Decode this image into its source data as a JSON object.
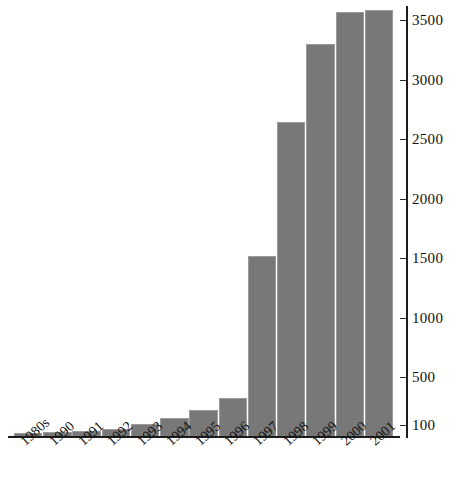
{
  "chart_data": {
    "type": "bar",
    "title": "",
    "subtitle": "",
    "xlabel": "",
    "ylabel": "",
    "categories": [
      "1980s",
      "1990",
      "1991",
      "1992",
      "1993",
      "1994",
      "1995",
      "1996",
      "1997",
      "1998",
      "1999",
      "2000",
      "2001"
    ],
    "values": [
      35,
      40,
      50,
      70,
      110,
      160,
      230,
      330,
      1520,
      2650,
      3300,
      3570,
      3590
    ],
    "ylim": [
      0,
      3620
    ],
    "yticks": [
      100,
      500,
      1000,
      1500,
      2000,
      2500,
      3000,
      3500
    ],
    "ytick_labels": [
      "100",
      "500",
      "1000",
      "1500",
      "2000",
      "2500",
      "3000",
      "3500"
    ],
    "grid": false,
    "legend": null,
    "legend_position": "none",
    "bar_color": "#787878",
    "bar_edge_color": "#9a9a9a",
    "axis_color": "#1c1c1c",
    "background_color": "#ffffff",
    "y_axis_side": "right",
    "xtick_label_rotation": -42,
    "annotations": []
  },
  "axes": {
    "y_axis_name": "y-axis",
    "x_axis_name": "x-axis"
  }
}
